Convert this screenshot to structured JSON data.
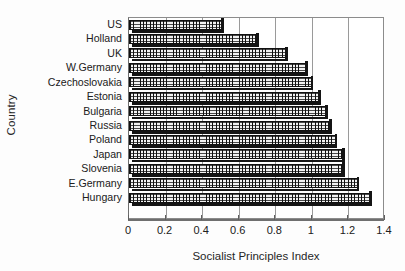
{
  "chart_data": {
    "type": "bar",
    "orientation": "horizontal",
    "title": "",
    "xlabel": "Socialist Principles Index",
    "ylabel": "Country",
    "categories": [
      "US",
      "Holland",
      "UK",
      "W.Germany",
      "Czechoslovakia",
      "Estonia",
      "Bulgaria",
      "Russia",
      "Poland",
      "Japan",
      "Slovenia",
      "E.Germany",
      "Hungary"
    ],
    "values": [
      0.51,
      0.7,
      0.86,
      0.97,
      1.0,
      1.04,
      1.08,
      1.1,
      1.13,
      1.17,
      1.17,
      1.25,
      1.32
    ],
    "xlim": [
      0,
      1.4
    ],
    "xticks": [
      0,
      0.2,
      0.4,
      0.6,
      0.8,
      1.0,
      1.2,
      1.4
    ],
    "xticklabels": [
      "0",
      "0.2",
      "0.4",
      "0.6",
      "0.8",
      "1",
      "1.2",
      "1.4"
    ],
    "grid": "vertical",
    "legend": "none",
    "bar_fill": "cross-hatch",
    "bar_edge_color": "#111111",
    "bar_face_color": "#f2f2f2"
  }
}
